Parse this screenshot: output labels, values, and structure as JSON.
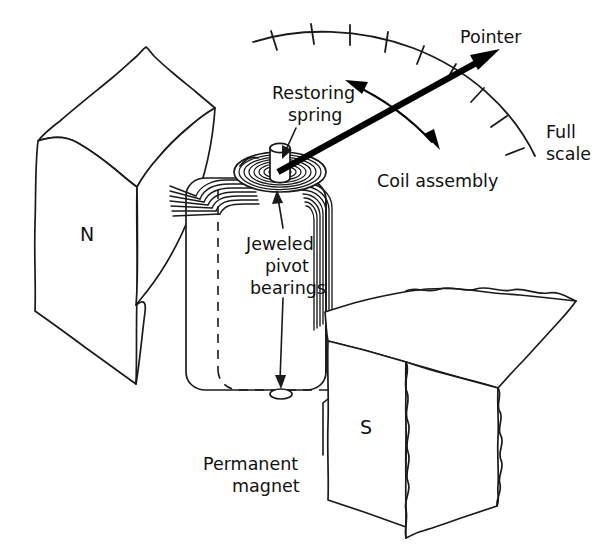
{
  "figure": {
    "background_color": "#ffffff",
    "line_color": "#1a1a1a",
    "accent_color": "#000000"
  },
  "labels": {
    "pointer": "Pointer",
    "full_scale_line1": "Full",
    "full_scale_line2": "scale",
    "restoring_spring_line1": "Restoring",
    "restoring_spring_line2": "spring",
    "coil_assembly": "Coil assembly",
    "jeweled_pivot_line1": "Jeweled",
    "jeweled_pivot_line2": "pivot",
    "jeweled_pivot_line3": "bearings",
    "permanent_magnet_line1": "Permanent",
    "permanent_magnet_line2": "magnet",
    "north_pole": "N",
    "south_pole": "S"
  },
  "scale": {
    "tick_count": 13,
    "start_angle_deg": 186,
    "end_angle_deg": 278,
    "center_x": 268,
    "center_y": 168,
    "radius": 170,
    "tick_length": 15
  },
  "pointer": {
    "pivot_x": 278,
    "pivot_y": 172,
    "tip_x": 495,
    "tip_y": 52,
    "deflection_label": "needle deflected toward upper right"
  },
  "components": [
    {
      "name": "north-pole-magnet",
      "letter": "N"
    },
    {
      "name": "south-pole-magnet",
      "letter": "S"
    },
    {
      "name": "coil-assembly",
      "winding_count": 7
    },
    {
      "name": "restoring-spring",
      "spiral_turns": 6
    },
    {
      "name": "upper-pivot-bearing"
    },
    {
      "name": "lower-pivot-bearing"
    }
  ]
}
